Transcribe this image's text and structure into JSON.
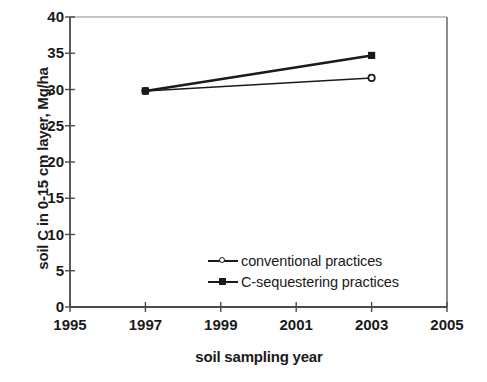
{
  "chart_data": {
    "type": "line",
    "title": "",
    "xlabel": "soil sampling year",
    "ylabel": "soil C in 0-15 cm layer, Mg/ha",
    "xlim": [
      1995,
      2005
    ],
    "ylim": [
      0,
      40
    ],
    "xticks": [
      1995,
      1997,
      1999,
      2001,
      2003,
      2005
    ],
    "yticks": [
      0,
      5,
      10,
      15,
      20,
      25,
      30,
      35,
      40
    ],
    "xtick_labels": [
      "1995",
      "1997",
      "1999",
      "2001",
      "2003",
      "2005"
    ],
    "ytick_labels": [
      "0",
      "5",
      "10",
      "15",
      "20",
      "25",
      "30",
      "35",
      "40"
    ],
    "grid": false,
    "legend_position": "inside-lower-right",
    "x": [
      1997,
      2003
    ],
    "series": [
      {
        "name": "conventional practices",
        "marker": "open-circle",
        "color": "#1a1a1a",
        "values": [
          29.8,
          31.6
        ]
      },
      {
        "name": "C-sequestering practices",
        "marker": "filled-square",
        "color": "#1a1a1a",
        "values": [
          29.8,
          34.7
        ]
      }
    ]
  },
  "legend": {
    "items": [
      {
        "label": "conventional practices",
        "marker": "open-circle"
      },
      {
        "label": "C-sequestering practices",
        "marker": "filled-square"
      }
    ]
  },
  "colors": {
    "ink": "#1a1a1a",
    "axis": "#4a4a4a",
    "background": "#ffffff"
  }
}
